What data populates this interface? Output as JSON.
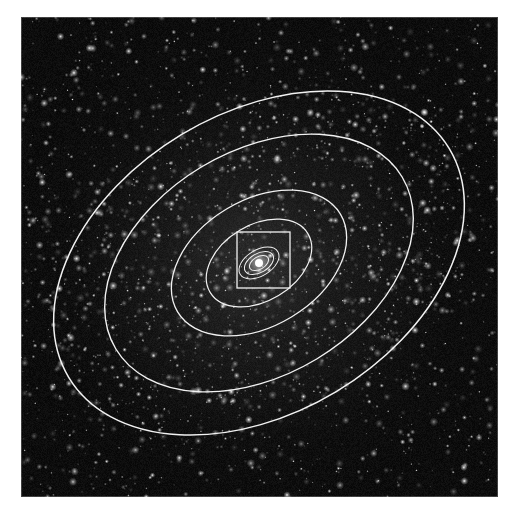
{
  "figure": {
    "kind": "astronomical-image-with-contours",
    "background_color": "#080808",
    "star_color": "#ffffff",
    "contour_color": "#f2f2f2",
    "plate": {
      "x": 21,
      "y": 17,
      "width": 477,
      "height": 480,
      "border_color": "#bbbbbb"
    }
  },
  "chart_data": {
    "type": "scatter",
    "title": "",
    "xlabel": "",
    "ylabel": "",
    "grid": false,
    "legend_position": "none",
    "xlim": [
      0,
      477
    ],
    "ylim": [
      0,
      480
    ],
    "center": {
      "x": 238,
      "y": 246
    },
    "position_angle_deg": -31,
    "star_field": {
      "count": 2600,
      "min_radius_px": 0.5,
      "max_radius_px": 1.9,
      "brightness_min": 0.18,
      "brightness_max": 1.0,
      "seed": 20240917
    },
    "nucleus": {
      "x": 238,
      "y": 246,
      "core_radius_px": 4.0,
      "halo_radius_px": 14,
      "peak_color": "#ffffff"
    },
    "ellipses": [
      {
        "label": "isophote-1-outer",
        "semi_major_px": 222,
        "semi_minor_px": 150,
        "angle_deg": -31,
        "stroke_width": 1.5
      },
      {
        "label": "isophote-2",
        "semi_major_px": 167,
        "semi_minor_px": 112,
        "angle_deg": -31,
        "stroke_width": 1.4
      },
      {
        "label": "isophote-3",
        "semi_major_px": 95,
        "semi_minor_px": 63,
        "angle_deg": -31,
        "stroke_width": 1.3
      },
      {
        "label": "isophote-4",
        "semi_major_px": 57,
        "semi_minor_px": 38,
        "angle_deg": -31,
        "stroke_width": 1.2
      },
      {
        "label": "isophote-5-inner",
        "semi_major_px": 22,
        "semi_minor_px": 13,
        "angle_deg": -31,
        "stroke_width": 1.0
      },
      {
        "label": "isophote-6-inner",
        "semi_major_px": 16,
        "semi_minor_px": 9.5,
        "angle_deg": -31,
        "stroke_width": 1.0
      },
      {
        "label": "isophote-7-core",
        "semi_major_px": 10.5,
        "semi_minor_px": 6.2,
        "angle_deg": -31,
        "stroke_width": 1.0
      }
    ],
    "aperture_box": {
      "label": "field-of-view-box",
      "x": 216,
      "y": 215,
      "width": 53,
      "height": 56,
      "stroke_width": 1.3
    }
  }
}
